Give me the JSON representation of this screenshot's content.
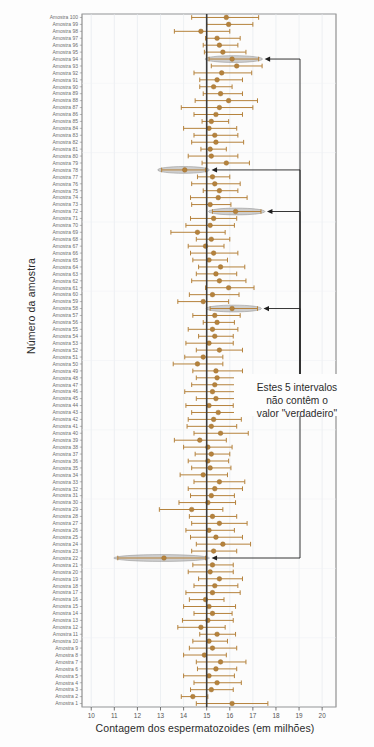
{
  "chart_data": {
    "type": "scatter",
    "title": "",
    "xlabel": "Contagem dos espermatozoides (em milhões)",
    "ylabel": "Número da amostra",
    "xlim": [
      9.6,
      20.6
    ],
    "xticks": [
      10,
      11,
      12,
      13,
      14,
      15,
      16,
      17,
      18,
      19,
      20
    ],
    "reference_line": {
      "value": 15,
      "label": "",
      "color": "#3a3a3a"
    },
    "grid": true,
    "legend": null,
    "annotations": [
      {
        "text": "Estes 5 intervalos não contêm o valor \"verdadeiro\"",
        "lines": [
          "Estes 5 intervalos",
          "não contêm o",
          "valor \"verdadeiro\""
        ],
        "points_to_samples": [
          94,
          78,
          72,
          58,
          22
        ]
      }
    ],
    "marker_color": "#b5823c",
    "error_color": "#b5823c",
    "highlight_color": "#a8a8a8",
    "categories_label_prefix": "Amostra",
    "series": [
      {
        "name": "Intervalos de confiança",
        "points": [
          {
            "sample": 100,
            "mean": 15.85,
            "low": 14.35,
            "high": 17.25,
            "highlight": false
          },
          {
            "sample": 99,
            "mean": 15.95,
            "low": 15.0,
            "high": 17.0,
            "highlight": false
          },
          {
            "sample": 98,
            "mean": 14.75,
            "low": 13.6,
            "high": 16.0,
            "highlight": false
          },
          {
            "sample": 97,
            "mean": 15.45,
            "low": 14.95,
            "high": 16.45,
            "highlight": false
          },
          {
            "sample": 96,
            "mean": 15.55,
            "low": 14.85,
            "high": 16.35,
            "highlight": false
          },
          {
            "sample": 95,
            "mean": 15.7,
            "low": 14.9,
            "high": 16.7,
            "highlight": false
          },
          {
            "sample": 94,
            "mean": 16.1,
            "low": 15.1,
            "high": 17.25,
            "highlight": true
          },
          {
            "sample": 93,
            "mean": 16.3,
            "low": 15.2,
            "high": 17.4,
            "highlight": false
          },
          {
            "sample": 92,
            "mean": 15.65,
            "low": 14.45,
            "high": 16.95,
            "highlight": false
          },
          {
            "sample": 91,
            "mean": 15.45,
            "low": 14.7,
            "high": 16.55,
            "highlight": false
          },
          {
            "sample": 90,
            "mean": 15.3,
            "low": 14.7,
            "high": 16.1,
            "highlight": false
          },
          {
            "sample": 89,
            "mean": 15.6,
            "low": 14.85,
            "high": 16.55,
            "highlight": false
          },
          {
            "sample": 88,
            "mean": 15.95,
            "low": 14.5,
            "high": 17.2,
            "highlight": false
          },
          {
            "sample": 87,
            "mean": 15.55,
            "low": 13.9,
            "high": 17.0,
            "highlight": false
          },
          {
            "sample": 86,
            "mean": 15.4,
            "low": 14.45,
            "high": 16.55,
            "highlight": false
          },
          {
            "sample": 85,
            "mean": 15.2,
            "low": 14.8,
            "high": 15.95,
            "highlight": false
          },
          {
            "sample": 84,
            "mean": 15.1,
            "low": 14.0,
            "high": 16.3,
            "highlight": false
          },
          {
            "sample": 83,
            "mean": 15.35,
            "low": 14.45,
            "high": 16.35,
            "highlight": false
          },
          {
            "sample": 82,
            "mean": 15.4,
            "low": 14.35,
            "high": 16.6,
            "highlight": false
          },
          {
            "sample": 81,
            "mean": 15.15,
            "low": 14.75,
            "high": 15.85,
            "highlight": false
          },
          {
            "sample": 80,
            "mean": 15.2,
            "low": 14.2,
            "high": 16.35,
            "highlight": false
          },
          {
            "sample": 79,
            "mean": 15.85,
            "low": 14.8,
            "high": 16.85,
            "highlight": false
          },
          {
            "sample": 78,
            "mean": 14.05,
            "low": 13.05,
            "high": 14.95,
            "highlight": true
          },
          {
            "sample": 77,
            "mean": 15.25,
            "low": 14.6,
            "high": 16.0,
            "highlight": false
          },
          {
            "sample": 76,
            "mean": 15.35,
            "low": 14.35,
            "high": 16.45,
            "highlight": false
          },
          {
            "sample": 75,
            "mean": 15.55,
            "low": 14.85,
            "high": 16.35,
            "highlight": false
          },
          {
            "sample": 74,
            "mean": 15.5,
            "low": 14.3,
            "high": 16.75,
            "highlight": false
          },
          {
            "sample": 73,
            "mean": 15.15,
            "low": 14.35,
            "high": 16.05,
            "highlight": false
          },
          {
            "sample": 72,
            "mean": 16.25,
            "low": 15.25,
            "high": 17.35,
            "highlight": true
          },
          {
            "sample": 71,
            "mean": 15.3,
            "low": 14.3,
            "high": 16.3,
            "highlight": false
          },
          {
            "sample": 70,
            "mean": 15.15,
            "low": 14.1,
            "high": 16.2,
            "highlight": false
          },
          {
            "sample": 69,
            "mean": 14.6,
            "low": 13.45,
            "high": 15.8,
            "highlight": false
          },
          {
            "sample": 68,
            "mean": 15.2,
            "low": 14.55,
            "high": 16.0,
            "highlight": false
          },
          {
            "sample": 67,
            "mean": 14.95,
            "low": 14.2,
            "high": 15.75,
            "highlight": false
          },
          {
            "sample": 66,
            "mean": 15.3,
            "low": 14.3,
            "high": 16.35,
            "highlight": false
          },
          {
            "sample": 65,
            "mean": 15.1,
            "low": 14.4,
            "high": 15.9,
            "highlight": false
          },
          {
            "sample": 64,
            "mean": 15.6,
            "low": 14.65,
            "high": 16.65,
            "highlight": false
          },
          {
            "sample": 63,
            "mean": 15.4,
            "low": 14.55,
            "high": 16.3,
            "highlight": false
          },
          {
            "sample": 62,
            "mean": 15.55,
            "low": 14.35,
            "high": 16.7,
            "highlight": false
          },
          {
            "sample": 61,
            "mean": 15.95,
            "low": 14.95,
            "high": 17.05,
            "highlight": false
          },
          {
            "sample": 60,
            "mean": 15.25,
            "low": 14.25,
            "high": 16.4,
            "highlight": false
          },
          {
            "sample": 59,
            "mean": 14.85,
            "low": 13.75,
            "high": 15.95,
            "highlight": false
          },
          {
            "sample": 58,
            "mean": 16.1,
            "low": 15.15,
            "high": 17.2,
            "highlight": true
          },
          {
            "sample": 57,
            "mean": 15.35,
            "low": 14.4,
            "high": 16.45,
            "highlight": false
          },
          {
            "sample": 56,
            "mean": 15.45,
            "low": 14.85,
            "high": 16.2,
            "highlight": false
          },
          {
            "sample": 55,
            "mean": 15.25,
            "low": 14.2,
            "high": 16.35,
            "highlight": false
          },
          {
            "sample": 54,
            "mean": 15.35,
            "low": 14.65,
            "high": 16.15,
            "highlight": false
          },
          {
            "sample": 53,
            "mean": 15.1,
            "low": 14.1,
            "high": 16.15,
            "highlight": false
          },
          {
            "sample": 52,
            "mean": 15.55,
            "low": 14.55,
            "high": 16.55,
            "highlight": false
          },
          {
            "sample": 51,
            "mean": 14.85,
            "low": 14.05,
            "high": 15.7,
            "highlight": false
          },
          {
            "sample": 50,
            "mean": 14.6,
            "low": 13.55,
            "high": 15.7,
            "highlight": false
          },
          {
            "sample": 49,
            "mean": 15.4,
            "low": 14.4,
            "high": 16.55,
            "highlight": false
          },
          {
            "sample": 48,
            "mean": 15.45,
            "low": 14.55,
            "high": 16.45,
            "highlight": false
          },
          {
            "sample": 47,
            "mean": 15.35,
            "low": 14.35,
            "high": 16.45,
            "highlight": false
          },
          {
            "sample": 46,
            "mean": 15.25,
            "low": 14.05,
            "high": 16.4,
            "highlight": false
          },
          {
            "sample": 45,
            "mean": 15.4,
            "low": 14.55,
            "high": 16.35,
            "highlight": false
          },
          {
            "sample": 44,
            "mean": 15.1,
            "low": 14.1,
            "high": 16.15,
            "highlight": false
          },
          {
            "sample": 43,
            "mean": 15.5,
            "low": 14.35,
            "high": 16.65,
            "highlight": false
          },
          {
            "sample": 42,
            "mean": 15.3,
            "low": 14.2,
            "high": 16.5,
            "highlight": false
          },
          {
            "sample": 41,
            "mean": 15.2,
            "low": 14.15,
            "high": 16.3,
            "highlight": false
          },
          {
            "sample": 40,
            "mean": 15.6,
            "low": 14.45,
            "high": 16.8,
            "highlight": false
          },
          {
            "sample": 39,
            "mean": 14.7,
            "low": 13.6,
            "high": 15.85,
            "highlight": false
          },
          {
            "sample": 38,
            "mean": 15.05,
            "low": 14.0,
            "high": 16.1,
            "highlight": false
          },
          {
            "sample": 37,
            "mean": 15.2,
            "low": 14.5,
            "high": 16.0,
            "highlight": false
          },
          {
            "sample": 36,
            "mean": 15.05,
            "low": 14.2,
            "high": 15.95,
            "highlight": false
          },
          {
            "sample": 35,
            "mean": 15.15,
            "low": 14.35,
            "high": 16.05,
            "highlight": false
          },
          {
            "sample": 34,
            "mean": 14.85,
            "low": 13.85,
            "high": 15.9,
            "highlight": false
          },
          {
            "sample": 33,
            "mean": 15.55,
            "low": 14.45,
            "high": 16.65,
            "highlight": false
          },
          {
            "sample": 32,
            "mean": 15.35,
            "low": 14.2,
            "high": 16.55,
            "highlight": false
          },
          {
            "sample": 31,
            "mean": 15.2,
            "low": 14.3,
            "high": 16.2,
            "highlight": false
          },
          {
            "sample": 30,
            "mean": 15.05,
            "low": 13.8,
            "high": 16.25,
            "highlight": false
          },
          {
            "sample": 29,
            "mean": 14.35,
            "low": 12.95,
            "high": 15.7,
            "highlight": false
          },
          {
            "sample": 28,
            "mean": 15.25,
            "low": 14.25,
            "high": 16.3,
            "highlight": false
          },
          {
            "sample": 27,
            "mean": 15.55,
            "low": 14.35,
            "high": 16.75,
            "highlight": false
          },
          {
            "sample": 26,
            "mean": 15.1,
            "low": 14.1,
            "high": 16.2,
            "highlight": false
          },
          {
            "sample": 25,
            "mean": 15.4,
            "low": 14.3,
            "high": 16.55,
            "highlight": false
          },
          {
            "sample": 24,
            "mean": 15.7,
            "low": 14.55,
            "high": 16.9,
            "highlight": false
          },
          {
            "sample": 23,
            "mean": 15.3,
            "low": 14.35,
            "high": 16.3,
            "highlight": false
          },
          {
            "sample": 22,
            "mean": 13.15,
            "low": 11.15,
            "high": 14.95,
            "highlight": true
          },
          {
            "sample": 21,
            "mean": 15.25,
            "low": 14.4,
            "high": 16.15,
            "highlight": false
          },
          {
            "sample": 20,
            "mean": 15.15,
            "low": 14.2,
            "high": 16.15,
            "highlight": false
          },
          {
            "sample": 19,
            "mean": 15.55,
            "low": 14.65,
            "high": 16.55,
            "highlight": false
          },
          {
            "sample": 18,
            "mean": 15.35,
            "low": 14.45,
            "high": 16.35,
            "highlight": false
          },
          {
            "sample": 17,
            "mean": 15.25,
            "low": 14.1,
            "high": 16.45,
            "highlight": false
          },
          {
            "sample": 16,
            "mean": 14.95,
            "low": 14.25,
            "high": 15.75,
            "highlight": false
          },
          {
            "sample": 15,
            "mean": 15.1,
            "low": 14.0,
            "high": 16.25,
            "highlight": false
          },
          {
            "sample": 14,
            "mean": 15.25,
            "low": 14.45,
            "high": 16.1,
            "highlight": false
          },
          {
            "sample": 13,
            "mean": 15.05,
            "low": 13.95,
            "high": 16.15,
            "highlight": false
          },
          {
            "sample": 12,
            "mean": 14.75,
            "low": 13.75,
            "high": 15.8,
            "highlight": false
          },
          {
            "sample": 11,
            "mean": 15.45,
            "low": 14.7,
            "high": 16.25,
            "highlight": false
          },
          {
            "sample": 10,
            "mean": 15.1,
            "low": 14.4,
            "high": 15.9,
            "highlight": false
          },
          {
            "sample": 9,
            "mean": 15.25,
            "low": 14.25,
            "high": 16.3,
            "highlight": false
          },
          {
            "sample": 8,
            "mean": 14.9,
            "low": 14.0,
            "high": 15.85,
            "highlight": false
          },
          {
            "sample": 7,
            "mean": 15.6,
            "low": 14.55,
            "high": 16.7,
            "highlight": false
          },
          {
            "sample": 6,
            "mean": 15.4,
            "low": 14.6,
            "high": 16.3,
            "highlight": false
          },
          {
            "sample": 5,
            "mean": 15.1,
            "low": 14.0,
            "high": 16.2,
            "highlight": false
          },
          {
            "sample": 4,
            "mean": 15.45,
            "low": 14.45,
            "high": 16.5,
            "highlight": false
          },
          {
            "sample": 3,
            "mean": 15.2,
            "low": 14.3,
            "high": 16.15,
            "highlight": false
          },
          {
            "sample": 2,
            "mean": 14.4,
            "low": 13.9,
            "high": 15.05,
            "highlight": false
          },
          {
            "sample": 1,
            "mean": 16.1,
            "low": 14.55,
            "high": 17.65,
            "highlight": false
          }
        ]
      }
    ]
  }
}
